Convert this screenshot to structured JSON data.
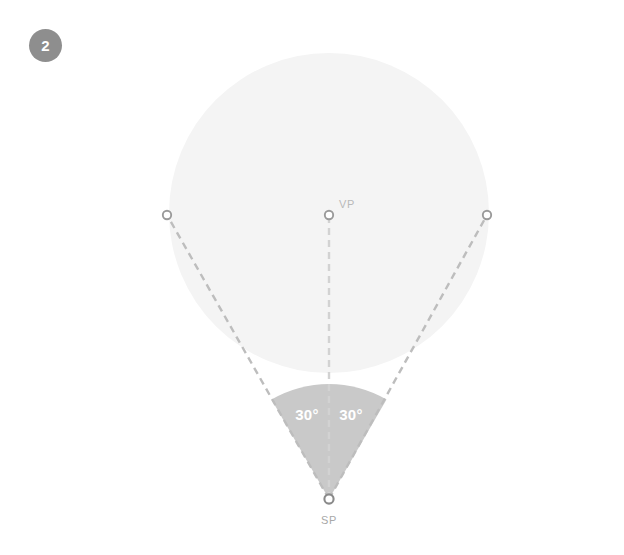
{
  "step": {
    "number": "2"
  },
  "diagram": {
    "title_labels": {
      "vanishing_point": "VP",
      "station_point": "SP"
    },
    "angles": {
      "left": "30°",
      "right": "30°"
    },
    "colors": {
      "background": "#ffffff",
      "cone_circle": "#f4f4f4",
      "wedge": "#c9c9c9",
      "dashed_line": "#bdbdbd",
      "center_dashed_line": "#d2d2d2",
      "horizon_line": "#c4c4c4",
      "marker_stroke": "#9a9a9a",
      "marker_sp_stroke": "#8a8a8a",
      "badge": "#8e8e8e",
      "badge_text": "#ffffff",
      "label_text": "#b9b9b9",
      "angle_text": "#ffffff"
    },
    "geometry": {
      "station_point": {
        "x": 329,
        "y": 499
      },
      "vanishing_point": {
        "x": 329,
        "y": 215
      },
      "left_point": {
        "x": 167,
        "y": 215
      },
      "right_point": {
        "x": 487,
        "y": 215
      },
      "cone_circle": {
        "cx": 329,
        "cy": 213,
        "r": 160
      },
      "horizon_y": 215,
      "wedge_arc_radius": 115,
      "total_cone_angle": "60°"
    }
  }
}
